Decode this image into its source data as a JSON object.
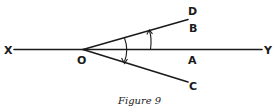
{
  "figure": {
    "caption": "Figure 9",
    "labels": {
      "X": "X",
      "Y": "Y",
      "O": "O",
      "A": "A",
      "B": "B",
      "C": "C",
      "D": "D"
    }
  }
}
